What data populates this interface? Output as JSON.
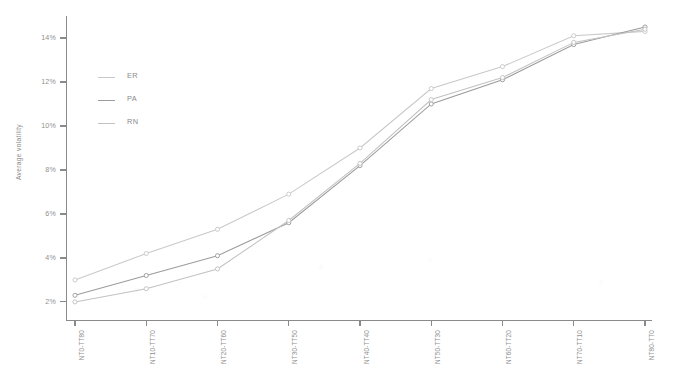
{
  "chart_data": {
    "type": "line",
    "title": "",
    "xlabel": "",
    "ylabel": "Average volatility",
    "ylim": [
      1.2,
      15.0
    ],
    "ytick_values": [
      2,
      4,
      6,
      8,
      10,
      12,
      14
    ],
    "ytick_labels": [
      "2%",
      "4%",
      "6%",
      "8%",
      "10%",
      "12%",
      "14%"
    ],
    "grid": false,
    "legend_position": "upper left",
    "categories": [
      "NT0-TT80",
      "NT10-TT70",
      "NT20-TT60",
      "NT30-TT50",
      "NT40-TT40",
      "NT50-TT30",
      "NT60-TT20",
      "NT70-TT10",
      "NT80-TT0"
    ],
    "series": [
      {
        "name": "ER",
        "color": "#c9c9c9",
        "marker": "circle",
        "values": [
          3.0,
          4.2,
          5.3,
          6.9,
          9.0,
          11.7,
          12.7,
          14.1,
          14.3
        ]
      },
      {
        "name": "PA",
        "color": "#9c9c9c",
        "marker": "circle",
        "values": [
          2.3,
          3.2,
          4.1,
          5.6,
          8.2,
          11.0,
          12.1,
          13.7,
          14.5
        ]
      },
      {
        "name": "RN",
        "color": "#c2c2c2",
        "marker": "circle",
        "values": [
          2.0,
          2.6,
          3.5,
          5.7,
          8.3,
          11.2,
          12.2,
          13.8,
          14.4
        ]
      }
    ]
  },
  "legend": {
    "entries": [
      {
        "label": "ER"
      },
      {
        "label": "PA"
      },
      {
        "label": "RN"
      }
    ]
  },
  "axes": {
    "y_title": "Average volatility"
  }
}
